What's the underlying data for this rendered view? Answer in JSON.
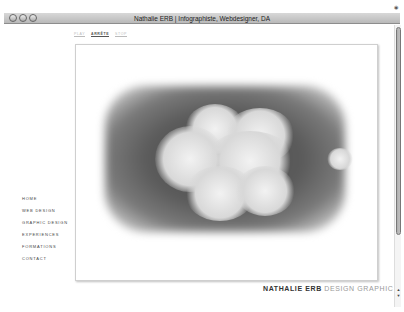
{
  "window": {
    "title": "Nathalie ERB | Infographiste, Webdesigner, DA",
    "controls": [
      "close",
      "minimize",
      "zoom"
    ]
  },
  "topnav": {
    "items": [
      {
        "label": "PLAY",
        "active": false
      },
      {
        "label": "ARRÊTE",
        "active": true
      },
      {
        "label": "STOP",
        "active": false
      }
    ]
  },
  "sidenav": {
    "items": [
      {
        "label": "HOME"
      },
      {
        "label": "WEB DESIGN"
      },
      {
        "label": "GRAPHIC DESIGN"
      },
      {
        "label": "EXPERIENCES"
      },
      {
        "label": "FORMATIONS"
      },
      {
        "label": "CONTACT"
      }
    ]
  },
  "brand": {
    "name": "NATHALIE ERB",
    "tagline": " DESIGN GRAPHIC"
  },
  "image": {
    "description": "fractal cloud artwork"
  },
  "scrollbar": {
    "up_icon": "▲",
    "down_icon": "▼"
  }
}
